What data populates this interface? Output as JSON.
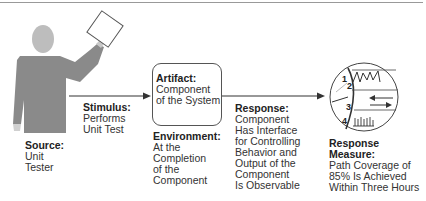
{
  "diagram": {
    "source": {
      "heading": "Source:",
      "lines": [
        "Unit",
        "Tester"
      ]
    },
    "stimulus": {
      "heading": "Stimulus:",
      "lines": [
        "Performs",
        "Unit Test"
      ]
    },
    "artifact": {
      "heading": "Artifact:",
      "lines": [
        "Component",
        "of the System"
      ]
    },
    "environment": {
      "heading": "Environment:",
      "lines": [
        "At the",
        "Completion",
        "of the",
        "Component"
      ]
    },
    "response": {
      "heading": "Response:",
      "lines": [
        "Component",
        "Has Interface",
        "for Controlling",
        "Behavior and",
        "Output of the",
        "Component",
        "Is Observable"
      ]
    },
    "response_measure": {
      "heading_lines": [
        "Response",
        "Measure:"
      ],
      "lines": [
        "Path Coverage of",
        "85% Is Achieved",
        "Within Three Hours"
      ]
    },
    "measure_icon": {
      "numbers": [
        "1",
        "2",
        "3",
        "4"
      ]
    },
    "colors": {
      "body": "#8a8a8a",
      "head": "#bdbdbd",
      "line": "#333333"
    }
  }
}
